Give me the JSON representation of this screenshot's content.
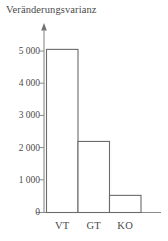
{
  "chart_data": {
    "type": "bar",
    "title": "Veränderungsvarianz",
    "xlabel": "",
    "ylabel": "",
    "categories": [
      "VT",
      "GT",
      "KO"
    ],
    "values": [
      5050,
      2200,
      530
    ],
    "series": [
      {
        "name": "Veränderungsvarianz",
        "values": [
          5050,
          2200,
          530
        ]
      }
    ],
    "ylim": [
      0,
      5400
    ],
    "yticks": [
      0,
      1000,
      2000,
      3000,
      4000,
      5000
    ],
    "ytick_labels": [
      "0",
      "1 000",
      "2 000",
      "3 000",
      "4 000",
      "5 000"
    ],
    "grid": false,
    "legend": false,
    "legend_position": "none",
    "bar_fill_color": "#ffffff",
    "bar_edge_color": "#6b6b6b",
    "axis_color": "#7a7a7a",
    "text_color": "#4a4a4a",
    "y_axis_arrow": true
  },
  "axes": {
    "ytick_0": "0",
    "ytick_1": "1 000",
    "ytick_2": "2 000",
    "ytick_3": "3 000",
    "ytick_4": "4 000",
    "ytick_5": "5 000",
    "xtick_0": "VT",
    "xtick_1": "GT",
    "xtick_2": "KO"
  }
}
